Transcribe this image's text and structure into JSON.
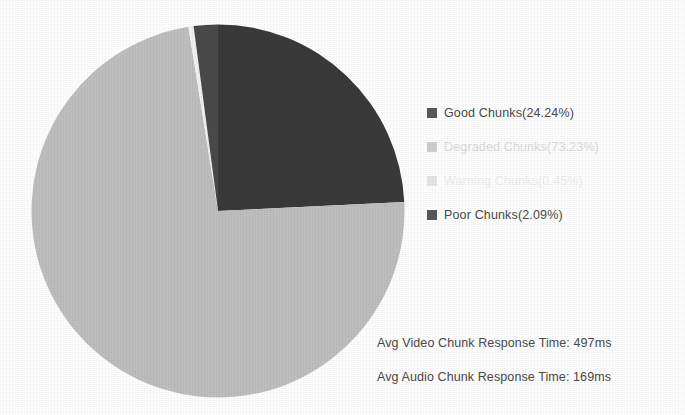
{
  "chart_data": {
    "type": "pie",
    "title": "",
    "legend_position": "right",
    "categories": [
      "Good Chunks",
      "Degraded Chunks",
      "Warning Chunks",
      "Poor Chunks"
    ],
    "values": [
      24.24,
      73.23,
      0.45,
      2.09
    ],
    "value_unit": "%",
    "colors": [
      "#3a3a3a",
      "#bfbfbf",
      "#f2f2f2",
      "#4a4a4a"
    ],
    "legend": [
      {
        "label": "Good Chunks(24.24%)",
        "name": "Good Chunks",
        "value": 24.24,
        "swatch_color": "#595959",
        "slice_color": "#3a3a3a",
        "text_color": "#4a4a4a"
      },
      {
        "label": "Degraded Chunks(73.23%)",
        "name": "Degraded Chunks",
        "value": 73.23,
        "swatch_color": "#cfcfcf",
        "slice_color": "#bfbfbf",
        "text_color": "#dcdcdc"
      },
      {
        "label": "Warning Chunks(0.45%)",
        "name": "Warning Chunks",
        "value": 0.45,
        "swatch_color": "#e6e6e6",
        "slice_color": "#f2f2f2",
        "text_color": "#efefef"
      },
      {
        "label": "Poor Chunks(2.09%)",
        "name": "Poor Chunks",
        "value": 2.09,
        "swatch_color": "#595959",
        "slice_color": "#4a4a4a",
        "text_color": "#4a4a4a"
      }
    ],
    "annotations": [
      "Avg Video Chunk Response Time: 497ms",
      "Avg Audio Chunk Response Time: 169ms"
    ]
  },
  "metrics": {
    "avg_video_chunk_response_time": "Avg Video Chunk Response Time: 497ms",
    "avg_audio_chunk_response_time": "Avg Audio Chunk Response Time: 169ms"
  }
}
